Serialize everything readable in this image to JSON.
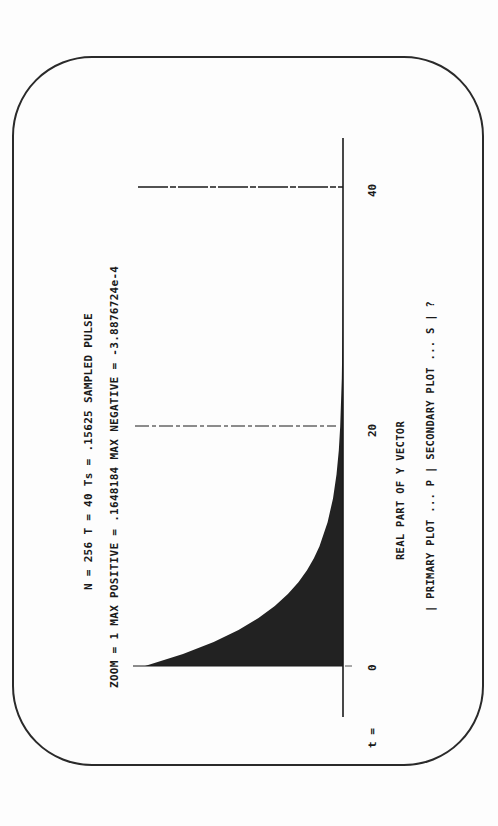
{
  "header": {
    "line1": "N = 256   T = 40   Ts = .15625   SAMPLED PULSE",
    "line2": "ZOOM = 1   MAX POSITIVE = .1648184   MAX NEGATIVE = -3.8876724e-4"
  },
  "axis": {
    "t_label": "t =",
    "ticks": [
      "0",
      "20",
      "40"
    ]
  },
  "footer": {
    "caption": "REAL PART OF Y VECTOR",
    "menu": "| PRIMARY PLOT ... P | SECONDARY PLOT ... S | ?"
  },
  "colors": {
    "ink": "#1a1a1a",
    "fill": "#222222",
    "paper": "#fdfdfd"
  },
  "chart_data": {
    "type": "area",
    "title": "SAMPLED PULSE",
    "subtitle": "N = 256, T = 40, Ts = .15625, ZOOM = 1",
    "xlabel": "t",
    "ylabel": "REAL PART OF Y VECTOR",
    "orientation": "rotated 90° (t axis vertical, increasing upward; amplitude extends left)",
    "x_ticks": [
      0,
      20,
      40
    ],
    "xlim": [
      0,
      40
    ],
    "ylim": [
      -0.00038876724,
      0.1648184
    ],
    "max_positive": 0.1648184,
    "max_negative": -0.00038876724,
    "grid": "dashed reference lines at t=20 and t=40",
    "legend": "none",
    "x": [
      0,
      1,
      2,
      3,
      4,
      5,
      6,
      7,
      8,
      9,
      10,
      12,
      14,
      16,
      18,
      20,
      24,
      28,
      32,
      36,
      40
    ],
    "values": [
      0.1648,
      0.1332,
      0.1076,
      0.087,
      0.0703,
      0.0568,
      0.0459,
      0.0371,
      0.03,
      0.0242,
      0.0196,
      0.0128,
      0.0083,
      0.0054,
      0.0035,
      0.0023,
      0.001,
      0.0004,
      0.0002,
      0.0001,
      0.0
    ]
  }
}
